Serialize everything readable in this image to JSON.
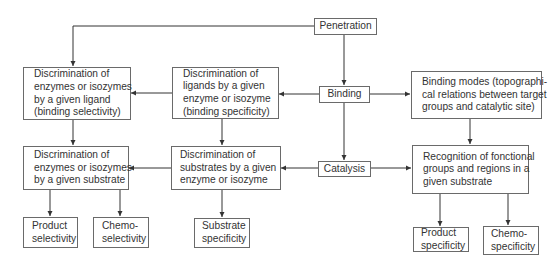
{
  "diagram": {
    "nodes": {
      "penetration": {
        "lines": [
          "Penetration"
        ]
      },
      "binding": {
        "lines": [
          "Binding"
        ]
      },
      "catalysis": {
        "lines": [
          "Catalysis"
        ]
      },
      "binding_selectivity": {
        "lines": [
          "Discrimination of",
          "enzymes or isozymes",
          "by a given ligand",
          "(binding selectivity)"
        ]
      },
      "binding_specificity": {
        "lines": [
          "Discrimination of",
          "ligands by a given",
          "enzyme or isozyme",
          "(binding specificity)"
        ]
      },
      "binding_modes": {
        "lines": [
          "Binding modes (topographi-",
          "cal relations between target",
          "groups and catalytic site)"
        ]
      },
      "enzymes_by_substrate": {
        "lines": [
          "Discrimination of",
          "enzymes or isozymes",
          "by a given substrate"
        ]
      },
      "substrates_by_enzyme": {
        "lines": [
          "Discrimination of",
          "substrates by a given",
          "enzyme or isozyme"
        ]
      },
      "recognition": {
        "lines": [
          "Recognition of fonctional",
          "groups and regions in a",
          "given substrate"
        ]
      },
      "product_selectivity": {
        "lines": [
          "Product",
          "selectivity"
        ]
      },
      "chemo_selectivity": {
        "lines": [
          "Chemo-",
          "selectivity"
        ]
      },
      "substrate_specificity": {
        "lines": [
          "Substrate",
          "specificity"
        ]
      },
      "product_specificity": {
        "lines": [
          "Product",
          "specificity"
        ]
      },
      "chemo_specificity": {
        "lines": [
          "Chemo-",
          "specificity"
        ]
      }
    },
    "edges": [
      [
        "penetration",
        "binding_selectivity"
      ],
      [
        "penetration",
        "binding"
      ],
      [
        "binding",
        "binding_specificity"
      ],
      [
        "binding",
        "binding_modes"
      ],
      [
        "binding_specificity",
        "binding_selectivity"
      ],
      [
        "binding",
        "catalysis"
      ],
      [
        "binding_selectivity",
        "enzymes_by_substrate"
      ],
      [
        "binding_specificity",
        "substrates_by_enzyme"
      ],
      [
        "binding_modes",
        "recognition"
      ],
      [
        "catalysis",
        "substrates_by_enzyme"
      ],
      [
        "catalysis",
        "recognition"
      ],
      [
        "substrates_by_enzyme",
        "enzymes_by_substrate"
      ],
      [
        "enzymes_by_substrate",
        "product_selectivity"
      ],
      [
        "enzymes_by_substrate",
        "chemo_selectivity"
      ],
      [
        "substrates_by_enzyme",
        "substrate_specificity"
      ],
      [
        "recognition",
        "product_specificity"
      ],
      [
        "recognition",
        "chemo_specificity"
      ]
    ],
    "colors": {
      "line": "#333333",
      "border": "#6a6a6a",
      "text": "#333333"
    }
  }
}
